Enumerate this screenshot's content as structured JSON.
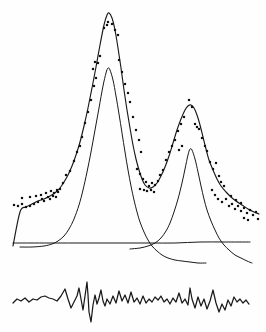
{
  "figure": {
    "title": "",
    "background_color": "#fefefe",
    "ink_color": "#1a1a1a",
    "point_color": "#111111",
    "width": 266,
    "height": 332
  },
  "chart_data": {
    "type": "line",
    "title": "",
    "subtitle": "",
    "xlabel": "",
    "ylabel": "",
    "xlim": [
      0,
      266
    ],
    "ylim": [
      0,
      332
    ],
    "grid": false,
    "legend": "none",
    "axes_visible": false,
    "annotations": [],
    "peaks": [
      {
        "name": "peak-1",
        "envelope_apex": {
          "x": 108,
          "y": 13
        },
        "component_apex": {
          "x": 105,
          "y": 68
        },
        "half_width": 22
      },
      {
        "name": "peak-2",
        "envelope_apex": {
          "x": 190,
          "y": 105
        },
        "component_apex": {
          "x": 190,
          "y": 148
        },
        "half_width": 17
      }
    ],
    "valley": {
      "x": 146,
      "y": 188
    },
    "series": [
      {
        "name": "fitted-envelope",
        "style": "solid-line",
        "points": [
          [
            13,
            246
          ],
          [
            20,
            212
          ],
          [
            26,
            207
          ],
          [
            32,
            204
          ],
          [
            38,
            201
          ],
          [
            44,
            199
          ],
          [
            50,
            196
          ],
          [
            56,
            192
          ],
          [
            60,
            188
          ],
          [
            64,
            182
          ],
          [
            68,
            175
          ],
          [
            72,
            166
          ],
          [
            76,
            155
          ],
          [
            80,
            142
          ],
          [
            84,
            126
          ],
          [
            88,
            108
          ],
          [
            92,
            88
          ],
          [
            96,
            67
          ],
          [
            100,
            45
          ],
          [
            104,
            25
          ],
          [
            107,
            15
          ],
          [
            109,
            13
          ],
          [
            112,
            18
          ],
          [
            115,
            30
          ],
          [
            118,
            48
          ],
          [
            121,
            68
          ],
          [
            124,
            90
          ],
          [
            127,
            110
          ],
          [
            130,
            128
          ],
          [
            133,
            145
          ],
          [
            136,
            159
          ],
          [
            139,
            170
          ],
          [
            142,
            179
          ],
          [
            145,
            185
          ],
          [
            149,
            188
          ],
          [
            153,
            187
          ],
          [
            157,
            183
          ],
          [
            161,
            176
          ],
          [
            165,
            167
          ],
          [
            169,
            156
          ],
          [
            173,
            143
          ],
          [
            177,
            130
          ],
          [
            181,
            119
          ],
          [
            185,
            110
          ],
          [
            188,
            106
          ],
          [
            191,
            105
          ],
          [
            194,
            108
          ],
          [
            197,
            115
          ],
          [
            200,
            125
          ],
          [
            203,
            137
          ],
          [
            206,
            149
          ],
          [
            209,
            160
          ],
          [
            213,
            170
          ],
          [
            217,
            179
          ],
          [
            221,
            186
          ],
          [
            226,
            192
          ],
          [
            231,
            197
          ],
          [
            236,
            201
          ],
          [
            242,
            205
          ],
          [
            248,
            209
          ],
          [
            254,
            212
          ],
          [
            259,
            214
          ]
        ]
      },
      {
        "name": "component-peak-1",
        "style": "solid-line",
        "points": [
          [
            20,
            247
          ],
          [
            32,
            247
          ],
          [
            44,
            246
          ],
          [
            52,
            244
          ],
          [
            58,
            241
          ],
          [
            64,
            236
          ],
          [
            69,
            229
          ],
          [
            74,
            219
          ],
          [
            79,
            205
          ],
          [
            83,
            190
          ],
          [
            87,
            172
          ],
          [
            91,
            152
          ],
          [
            95,
            130
          ],
          [
            99,
            108
          ],
          [
            103,
            86
          ],
          [
            106,
            73
          ],
          [
            108,
            68
          ],
          [
            110,
            70
          ],
          [
            113,
            80
          ],
          [
            116,
            96
          ],
          [
            119,
            114
          ],
          [
            122,
            133
          ],
          [
            125,
            152
          ],
          [
            128,
            170
          ],
          [
            131,
            186
          ],
          [
            134,
            200
          ],
          [
            137,
            212
          ],
          [
            140,
            222
          ],
          [
            144,
            232
          ],
          [
            148,
            240
          ],
          [
            152,
            246
          ],
          [
            157,
            251
          ],
          [
            162,
            255
          ],
          [
            168,
            258
          ],
          [
            175,
            260
          ],
          [
            182,
            261
          ],
          [
            190,
            262
          ],
          [
            198,
            263
          ],
          [
            206,
            263
          ]
        ]
      },
      {
        "name": "component-peak-2",
        "style": "solid-line",
        "points": [
          [
            130,
            249
          ],
          [
            140,
            248
          ],
          [
            148,
            246
          ],
          [
            155,
            243
          ],
          [
            161,
            238
          ],
          [
            166,
            231
          ],
          [
            170,
            223
          ],
          [
            174,
            212
          ],
          [
            178,
            199
          ],
          [
            182,
            183
          ],
          [
            185,
            169
          ],
          [
            188,
            155
          ],
          [
            190,
            149
          ],
          [
            192,
            150
          ],
          [
            195,
            159
          ],
          [
            198,
            172
          ],
          [
            201,
            186
          ],
          [
            204,
            199
          ],
          [
            207,
            210
          ],
          [
            211,
            221
          ],
          [
            215,
            230
          ],
          [
            219,
            238
          ],
          [
            224,
            245
          ],
          [
            229,
            250
          ],
          [
            235,
            255
          ],
          [
            241,
            258
          ],
          [
            247,
            261
          ],
          [
            252,
            263
          ]
        ]
      },
      {
        "name": "background-baseline",
        "style": "solid-line",
        "points": [
          [
            13,
            243
          ],
          [
            30,
            243
          ],
          [
            50,
            243
          ],
          [
            75,
            243
          ],
          [
            100,
            243
          ],
          [
            125,
            243
          ],
          [
            150,
            243
          ],
          [
            175,
            243
          ],
          [
            200,
            242
          ],
          [
            225,
            242
          ],
          [
            250,
            242
          ]
        ]
      },
      {
        "name": "residual-trace",
        "style": "solid-line",
        "points": [
          [
            13,
            303
          ],
          [
            17,
            299
          ],
          [
            21,
            301
          ],
          [
            25,
            298
          ],
          [
            29,
            302
          ],
          [
            33,
            299
          ],
          [
            37,
            300
          ],
          [
            41,
            297
          ],
          [
            45,
            296
          ],
          [
            49,
            298
          ],
          [
            53,
            299
          ],
          [
            57,
            301
          ],
          [
            61,
            296
          ],
          [
            65,
            289
          ],
          [
            68,
            299
          ],
          [
            71,
            308
          ],
          [
            74,
            302
          ],
          [
            77,
            296
          ],
          [
            79,
            288
          ],
          [
            81,
            299
          ],
          [
            83,
            310
          ],
          [
            85,
            296
          ],
          [
            87,
            282
          ],
          [
            88,
            295
          ],
          [
            89,
            312
          ],
          [
            91,
            322
          ],
          [
            93,
            305
          ],
          [
            95,
            295
          ],
          [
            97,
            304
          ],
          [
            99,
            298
          ],
          [
            101,
            290
          ],
          [
            103,
            301
          ],
          [
            105,
            306
          ],
          [
            107,
            299
          ],
          [
            110,
            304
          ],
          [
            113,
            296
          ],
          [
            116,
            303
          ],
          [
            119,
            291
          ],
          [
            122,
            301
          ],
          [
            125,
            295
          ],
          [
            128,
            303
          ],
          [
            131,
            292
          ],
          [
            134,
            302
          ],
          [
            137,
            298
          ],
          [
            140,
            304
          ],
          [
            143,
            296
          ],
          [
            146,
            303
          ],
          [
            149,
            299
          ],
          [
            152,
            302
          ],
          [
            155,
            297
          ],
          [
            158,
            300
          ],
          [
            161,
            296
          ],
          [
            164,
            302
          ],
          [
            167,
            299
          ],
          [
            170,
            304
          ],
          [
            173,
            298
          ],
          [
            176,
            302
          ],
          [
            179,
            293
          ],
          [
            182,
            303
          ],
          [
            185,
            299
          ],
          [
            188,
            305
          ],
          [
            190,
            288
          ],
          [
            192,
            299
          ],
          [
            195,
            308
          ],
          [
            198,
            297
          ],
          [
            201,
            306
          ],
          [
            204,
            299
          ],
          [
            207,
            309
          ],
          [
            210,
            301
          ],
          [
            213,
            290
          ],
          [
            216,
            303
          ],
          [
            219,
            312
          ],
          [
            222,
            304
          ],
          [
            225,
            310
          ],
          [
            228,
            300
          ],
          [
            231,
            306
          ],
          [
            234,
            297
          ],
          [
            237,
            302
          ],
          [
            240,
            299
          ],
          [
            243,
            303
          ],
          [
            246,
            300
          ],
          [
            249,
            304
          ]
        ]
      }
    ],
    "data_points": [
      [
        14,
        205
      ],
      [
        18,
        206
      ],
      [
        22,
        204
      ],
      [
        26,
        207
      ],
      [
        30,
        206
      ],
      [
        34,
        204
      ],
      [
        38,
        202
      ],
      [
        42,
        199
      ],
      [
        44,
        201
      ],
      [
        48,
        197
      ],
      [
        50,
        199
      ],
      [
        53,
        196
      ],
      [
        56,
        197
      ],
      [
        58,
        192
      ],
      [
        60,
        189
      ],
      [
        22,
        198
      ],
      [
        30,
        197
      ],
      [
        36,
        196
      ],
      [
        41,
        195
      ],
      [
        46,
        193
      ],
      [
        51,
        191
      ],
      [
        54,
        193
      ],
      [
        57,
        190
      ],
      [
        63,
        183
      ],
      [
        66,
        175
      ],
      [
        70,
        171
      ],
      [
        74,
        161
      ],
      [
        77,
        152
      ],
      [
        80,
        146
      ],
      [
        82,
        137
      ],
      [
        85,
        123
      ],
      [
        88,
        112
      ],
      [
        91,
        100
      ],
      [
        94,
        86
      ],
      [
        96,
        78
      ],
      [
        98,
        63
      ],
      [
        100,
        56
      ],
      [
        93,
        69
      ],
      [
        95,
        62
      ],
      [
        104,
        28
      ],
      [
        107,
        25
      ],
      [
        108,
        22
      ],
      [
        112,
        24
      ],
      [
        115,
        30
      ],
      [
        118,
        35
      ],
      [
        119,
        60
      ],
      [
        122,
        72
      ],
      [
        125,
        84
      ],
      [
        128,
        93
      ],
      [
        130,
        102
      ],
      [
        133,
        117
      ],
      [
        136,
        130
      ],
      [
        139,
        140
      ],
      [
        141,
        152
      ],
      [
        137,
        169
      ],
      [
        140,
        174
      ],
      [
        143,
        179
      ],
      [
        146,
        182
      ],
      [
        149,
        186
      ],
      [
        152,
        183
      ],
      [
        155,
        185
      ],
      [
        158,
        181
      ],
      [
        140,
        189
      ],
      [
        144,
        190
      ],
      [
        147,
        191
      ],
      [
        151,
        190
      ],
      [
        154,
        192
      ],
      [
        160,
        175
      ],
      [
        163,
        170
      ],
      [
        166,
        160
      ],
      [
        169,
        152
      ],
      [
        172,
        146
      ],
      [
        175,
        140
      ],
      [
        178,
        131
      ],
      [
        181,
        124
      ],
      [
        184,
        117
      ],
      [
        179,
        150
      ],
      [
        182,
        146
      ],
      [
        189,
        100
      ],
      [
        192,
        107
      ],
      [
        195,
        124
      ],
      [
        197,
        127
      ],
      [
        199,
        129
      ],
      [
        202,
        138
      ],
      [
        205,
        146
      ],
      [
        207,
        151
      ],
      [
        210,
        162
      ],
      [
        213,
        169
      ],
      [
        216,
        163
      ],
      [
        219,
        176
      ],
      [
        221,
        182
      ],
      [
        224,
        186
      ],
      [
        212,
        190
      ],
      [
        215,
        195
      ],
      [
        218,
        199
      ],
      [
        222,
        202
      ],
      [
        226,
        199
      ],
      [
        229,
        206
      ],
      [
        232,
        204
      ],
      [
        235,
        209
      ],
      [
        238,
        206
      ],
      [
        241,
        211
      ],
      [
        244,
        208
      ],
      [
        247,
        213
      ],
      [
        250,
        210
      ],
      [
        253,
        215
      ],
      [
        256,
        212
      ],
      [
        258,
        219
      ],
      [
        248,
        220
      ],
      [
        244,
        218
      ],
      [
        231,
        196
      ],
      [
        236,
        200
      ],
      [
        241,
        203
      ]
    ]
  }
}
